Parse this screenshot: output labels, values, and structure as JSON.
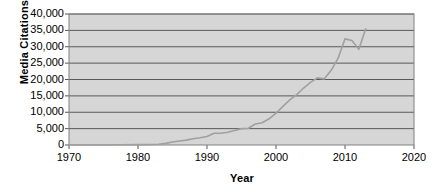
{
  "chart_data": {
    "type": "line",
    "title": "",
    "xlabel": "Year",
    "ylabel": "Media Citations",
    "xlim": [
      1970,
      2020
    ],
    "ylim": [
      0,
      40000
    ],
    "grid": true,
    "legend": "none",
    "xticks": [
      "1970",
      "1980",
      "1990",
      "2000",
      "2010",
      "2020"
    ],
    "xtick_values": [
      1970,
      1980,
      1990,
      2000,
      2010,
      2020
    ],
    "yticks": [
      "0",
      "5,000",
      "10,000",
      "15,000",
      "20,000",
      "25,000",
      "30,000",
      "35,000",
      "40,000"
    ],
    "ytick_values": [
      0,
      5000,
      10000,
      15000,
      20000,
      25000,
      30000,
      35000,
      40000
    ],
    "series": [
      {
        "name": "Media Citations",
        "color": "#a0a0a0",
        "x": [
          1970,
          1975,
          1980,
          1982,
          1983,
          1984,
          1985,
          1986,
          1987,
          1988,
          1989,
          1990,
          1991,
          1992,
          1993,
          1994,
          1995,
          1996,
          1997,
          1998,
          1999,
          2000,
          2001,
          2002,
          2003,
          2004,
          2005,
          2006,
          2007,
          2008,
          2009,
          2010,
          2011,
          2012,
          2013
        ],
        "values": [
          0,
          0,
          100,
          150,
          250,
          500,
          900,
          1200,
          1500,
          1900,
          2200,
          2600,
          3600,
          3600,
          3900,
          4400,
          5000,
          5100,
          6400,
          6800,
          8000,
          9700,
          11800,
          13800,
          15400,
          17400,
          19100,
          20500,
          20200,
          22800,
          26500,
          32400,
          31900,
          29200,
          35500
        ]
      }
    ]
  },
  "axes": {
    "plot_bg": "#d6d6d6",
    "grid_color": "#595959",
    "border_color": "#808080",
    "line_color": "#a0a0a0"
  }
}
